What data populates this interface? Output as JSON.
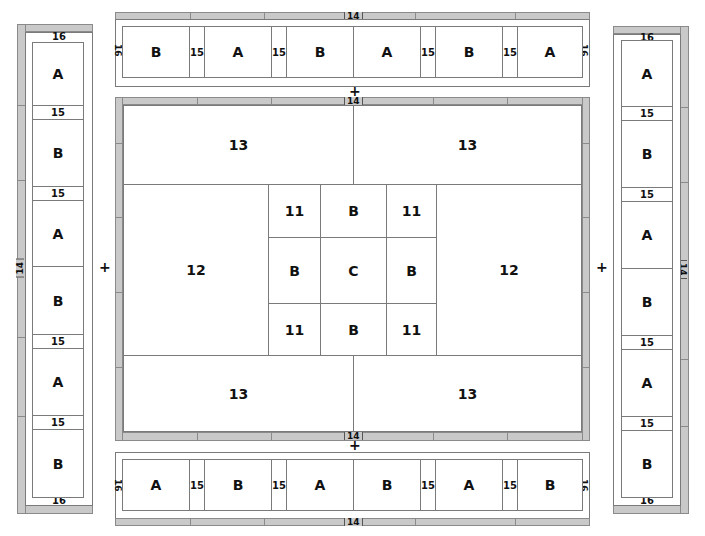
{
  "diagram": {
    "left_column": {
      "top_label": "16",
      "bottom_label": "16",
      "side_label": "14",
      "cells": [
        "A",
        "15",
        "B",
        "15",
        "A",
        "B",
        "15",
        "A",
        "15",
        "B"
      ]
    },
    "right_column": {
      "top_label": "16",
      "bottom_label": "16",
      "side_label": "14",
      "cells": [
        "A",
        "15",
        "B",
        "15",
        "A",
        "B",
        "15",
        "A",
        "15",
        "B"
      ]
    },
    "top_row": {
      "top_label": "14",
      "left_label": "16",
      "right_label": "16",
      "cells": [
        "B",
        "15",
        "A",
        "15",
        "B",
        "A",
        "15",
        "B",
        "15",
        "A"
      ]
    },
    "bottom_row": {
      "bottom_label": "14",
      "left_label": "16",
      "right_label": "16",
      "cells": [
        "A",
        "15",
        "B",
        "15",
        "A",
        "B",
        "15",
        "A",
        "15",
        "B"
      ]
    },
    "main_panel": {
      "top_label": "14",
      "bottom_label": "14",
      "top_left": "13",
      "top_right": "13",
      "bottom_left": "13",
      "bottom_right": "13",
      "left": "12",
      "right": "12",
      "grid": [
        "11",
        "B",
        "11",
        "B",
        "C",
        "B",
        "11",
        "B",
        "11"
      ]
    },
    "joiners": {
      "top": "+",
      "bottom": "+",
      "left": "+",
      "right": "+"
    }
  }
}
